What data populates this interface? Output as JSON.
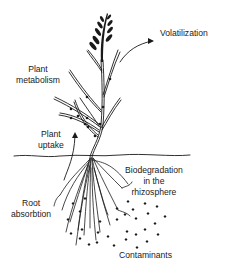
{
  "diagram": {
    "topic": "Phytoremediation processes",
    "labels": {
      "volatilization": "Volatilization",
      "plant_metabolism_line1": "Plant",
      "plant_metabolism_line2": "metabolism",
      "plant_uptake_line1": "Plant",
      "plant_uptake_line2": "uptake",
      "biodegradation_line1": "Biodegradation",
      "biodegradation_line2": "in the",
      "biodegradation_line3": "rhizosphere",
      "root_absorption_line1": "Root",
      "root_absorption_line2": "absorbtion",
      "contaminants": "Contaminants"
    },
    "colors": {
      "ink": "#1a1a1a",
      "background": "#ffffff"
    }
  }
}
